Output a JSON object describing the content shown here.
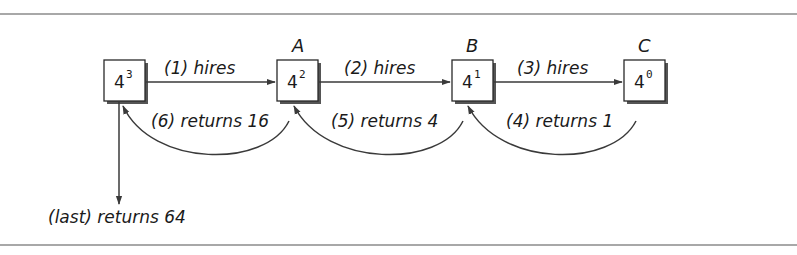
{
  "diagram": {
    "nodes": [
      {
        "id": "n0",
        "label": "",
        "base": "4",
        "exp": "3",
        "x": 104
      },
      {
        "id": "n1",
        "label": "A",
        "base": "4",
        "exp": "2",
        "x": 277
      },
      {
        "id": "n2",
        "label": "B",
        "base": "4",
        "exp": "1",
        "x": 452
      },
      {
        "id": "n3",
        "label": "C",
        "base": "4",
        "exp": "0",
        "x": 624
      }
    ],
    "forward_edges": [
      {
        "from": "n0",
        "to": "n1",
        "label": "(1) hires"
      },
      {
        "from": "n1",
        "to": "n2",
        "label": "(2) hires"
      },
      {
        "from": "n2",
        "to": "n3",
        "label": "(3) hires"
      }
    ],
    "return_edges": [
      {
        "from": "n3",
        "to": "n2",
        "label": "(4) returns 1"
      },
      {
        "from": "n2",
        "to": "n1",
        "label": "(5) returns 4"
      },
      {
        "from": "n1",
        "to": "n0",
        "label": "(6) returns 16"
      }
    ],
    "final_edge": {
      "from": "n0",
      "label": "(last) returns 64"
    },
    "colors": {
      "stroke": "#3a3a3a",
      "text": "#1a1a1a",
      "rule": "#a8a8a8",
      "shadow": "#555555"
    }
  }
}
